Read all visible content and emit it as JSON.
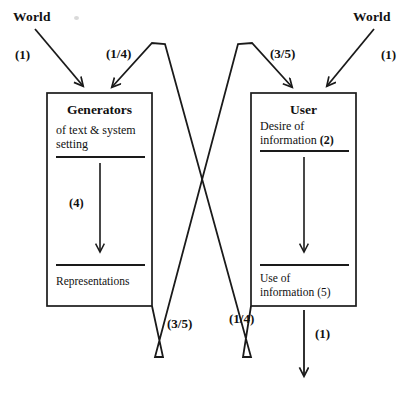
{
  "figure": {
    "type": "flow-diagram",
    "background_color": "#ffffff",
    "line_color": "#1a1a1a",
    "text_color": "#111111"
  },
  "external_sources": {
    "left": {
      "label": "World"
    },
    "right": {
      "label": "World"
    }
  },
  "flow_labels": {
    "top_left_in": "(1)",
    "top_left_cross": "(1/4)",
    "top_right_cross": "(3/5)",
    "top_right_in": "(1)",
    "bottom_left_cross": "(3/5)",
    "bottom_right_cross": "(1/4)",
    "bottom_right_out": "(1)"
  },
  "boxes": [
    {
      "id": "generators",
      "title": "Generators",
      "subtitle_line1": "of text & system",
      "subtitle_line2": "setting",
      "internal_arrow_label": "(4)",
      "footer_line1": "Representations",
      "footer_line2": ""
    },
    {
      "id": "user",
      "title": "User",
      "subtitle_line1": "Desire of",
      "subtitle_line2": "information ",
      "subtitle_bold_tail": "(2)",
      "internal_arrow_label": "",
      "footer_line1": "Use of",
      "footer_line2": "information (5)"
    }
  ]
}
